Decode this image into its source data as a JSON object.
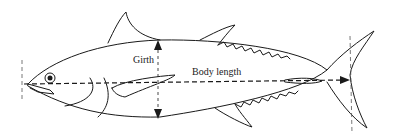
{
  "diagram": {
    "labels": {
      "girth": "Girth",
      "body_length": "Body length"
    },
    "colors": {
      "line": "#1a1a1a",
      "background": "#ffffff"
    }
  }
}
